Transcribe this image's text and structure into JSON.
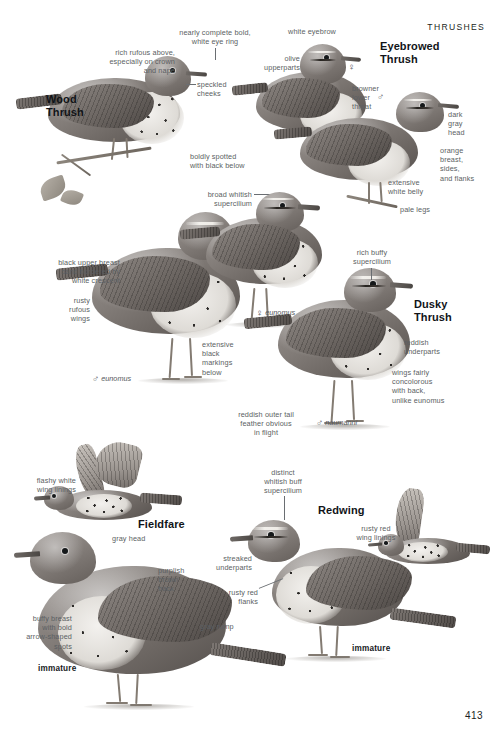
{
  "page": {
    "section_header": "THRUSHES",
    "page_number": "413"
  },
  "species": [
    {
      "id": "wood-thrush",
      "name": "Wood\nThrush",
      "labels": [
        "nearly complete bold,\nwhite eye ring",
        "rich rufous above,\nespecially on crown\nand nape",
        "speckled\ncheeks",
        "boldly spotted\nwith black below"
      ]
    },
    {
      "id": "eyebrowed-thrush",
      "name": "Eyebrowed\nThrush",
      "labels": [
        "white eyebrow",
        "olive\nupperparts",
        "browner\nlower\nthroat",
        "dark\ngray\nhead",
        "orange\nbreast,\nsides,\nand flanks",
        "extensive\nwhite belly",
        "pale legs"
      ],
      "sex_marks": [
        "female",
        "male"
      ]
    },
    {
      "id": "dusky-thrush",
      "name": "Dusky\nThrush",
      "labels": [
        "broad whitish\nsupercilium",
        "black upper breast\nband bordered by\nwhite crescent",
        "rusty\nrufous\nwings",
        "extensive\nblack\nmarkings\nbelow",
        "rich buffy\nsupercilium",
        "reddish\nunderparts",
        "wings fairly\nconcolorous\nwith back,\nunlike eunomus",
        "reddish outer tail\nfeather obvious\nin flight"
      ],
      "subspecies_marks": [
        {
          "sex": "male",
          "name": "eunomus"
        },
        {
          "sex": "female",
          "name": "eunomus"
        },
        {
          "sex": "male",
          "name": "naumanni"
        }
      ]
    },
    {
      "id": "fieldfare",
      "name": "Fieldfare",
      "labels": [
        "flashy white\nwing linings",
        "gray head",
        "purplish\nbrown\nback",
        "gray rump",
        "buffy breast\nwith bold\narrow-shaped\nspots"
      ],
      "age_marks": [
        "immature"
      ]
    },
    {
      "id": "redwing",
      "name": "Redwing",
      "labels": [
        "distinct\nwhitish buff\nsupercilium",
        "rusty red\nwing linings",
        "streaked\nunderparts",
        "rusty red\nflanks"
      ],
      "age_marks": [
        "immature"
      ]
    }
  ],
  "symbols": {
    "male": "♂",
    "female": "♀"
  },
  "colors": {
    "label_text": "#5b5f63",
    "heading_text": "#111418",
    "page_background": "#ffffff",
    "leader_line": "#6a6e72"
  }
}
